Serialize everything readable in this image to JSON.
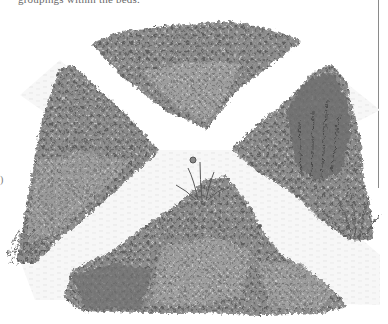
{
  "page": {
    "caption_fragment": "groupings within the beds.",
    "left_margin_mark": ")"
  },
  "illustration": {
    "subject": "pencil drawing of a formal garden with four triangular planting beds divided by an X-shaped path",
    "style": "grayscale pencil sketch",
    "beds": [
      {
        "id": "top-bed",
        "position": "top",
        "description": "dense low mounded perennials, tall flower spikes at back"
      },
      {
        "id": "left-bed",
        "position": "left",
        "description": "mat-forming ground cover with grassy clumps at the bottom"
      },
      {
        "id": "right-bed",
        "position": "right",
        "description": "tall upright shrub with spiky-leaved plant in foreground"
      },
      {
        "id": "bottom-bed",
        "position": "bottom",
        "description": "iris at the apex, mounded shrubs and perennials along front"
      }
    ],
    "path": {
      "shape": "X-shaped gravel path",
      "color": "#f4f4f4"
    },
    "colors": {
      "ink_dark": "#4a4a4a",
      "ink_mid": "#7a7a7a",
      "ink_light": "#a9a9a9",
      "paper": "#ffffff"
    }
  }
}
